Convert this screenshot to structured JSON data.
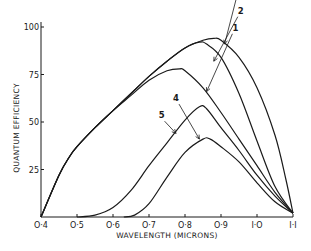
{
  "chart_data": {
    "type": "line",
    "title": "",
    "xlabel": "WAVELENGTH (MICRONS)",
    "ylabel": "QUANTUM EFFICIENCY",
    "xlim": [
      0.4,
      1.1
    ],
    "ylim": [
      0,
      100
    ],
    "grid": false,
    "x_ticks": [
      0.4,
      0.5,
      0.6,
      0.7,
      0.8,
      0.9,
      1.0,
      1.1
    ],
    "x_tick_labels": [
      "O·4",
      "O·5",
      "O·6",
      "O·7",
      "O·8",
      "O·9",
      "I·O",
      "I·I"
    ],
    "y_ticks": [
      25,
      50,
      75,
      100
    ],
    "y_tick_labels": [
      "25",
      "50",
      "75",
      "100"
    ],
    "series": [
      {
        "name": "1",
        "points": [
          [
            0.4,
            0
          ],
          [
            0.45,
            22
          ],
          [
            0.48,
            32
          ],
          [
            0.5,
            37
          ],
          [
            0.55,
            47
          ],
          [
            0.6,
            56
          ],
          [
            0.65,
            64
          ],
          [
            0.7,
            72
          ],
          [
            0.75,
            77
          ],
          [
            0.785,
            78
          ],
          [
            0.8,
            77
          ],
          [
            0.85,
            68
          ],
          [
            0.9,
            55
          ],
          [
            0.95,
            41
          ],
          [
            1.0,
            27
          ],
          [
            1.05,
            13
          ],
          [
            1.1,
            2
          ]
        ],
        "label_at": [
          0.94,
          98
        ],
        "arrow_to": [
          0.86,
          66
        ]
      },
      {
        "name": "2",
        "points": [
          [
            0.4,
            0
          ],
          [
            0.45,
            22
          ],
          [
            0.48,
            32
          ],
          [
            0.5,
            37
          ],
          [
            0.55,
            47
          ],
          [
            0.6,
            56
          ],
          [
            0.65,
            65
          ],
          [
            0.7,
            74
          ],
          [
            0.75,
            82
          ],
          [
            0.8,
            89
          ],
          [
            0.84,
            92
          ],
          [
            0.86,
            91
          ],
          [
            0.9,
            84
          ],
          [
            0.95,
            65
          ],
          [
            1.0,
            40
          ],
          [
            1.05,
            16
          ],
          [
            1.1,
            2
          ]
        ],
        "label_at": [
          0.955,
          107
        ],
        "arrow_to": [
          0.88,
          82
        ]
      },
      {
        "name": "3",
        "points": [
          [
            0.4,
            0
          ],
          [
            0.45,
            22
          ],
          [
            0.48,
            32
          ],
          [
            0.5,
            37
          ],
          [
            0.55,
            47
          ],
          [
            0.6,
            56
          ],
          [
            0.65,
            65
          ],
          [
            0.7,
            74
          ],
          [
            0.75,
            82
          ],
          [
            0.8,
            89
          ],
          [
            0.85,
            93
          ],
          [
            0.88,
            94
          ],
          [
            0.9,
            93
          ],
          [
            0.95,
            84
          ],
          [
            1.0,
            68
          ],
          [
            1.05,
            43
          ],
          [
            1.08,
            20
          ],
          [
            1.1,
            2
          ]
        ],
        "label_at": [
          0.95,
          116
        ],
        "arrow_to": [
          0.91,
          91
        ]
      },
      {
        "name": "4",
        "points": [
          [
            0.5,
            0
          ],
          [
            0.55,
            1
          ],
          [
            0.6,
            5
          ],
          [
            0.65,
            14
          ],
          [
            0.7,
            27
          ],
          [
            0.75,
            39
          ],
          [
            0.8,
            51
          ],
          [
            0.84,
            58
          ],
          [
            0.86,
            57
          ],
          [
            0.9,
            47
          ],
          [
            0.95,
            35
          ],
          [
            1.0,
            22
          ],
          [
            1.05,
            11
          ],
          [
            1.1,
            2
          ]
        ],
        "label_at": [
          0.775,
          61
        ],
        "arrow_to": [
          0.84,
          41
        ]
      },
      {
        "name": "5",
        "points": [
          [
            0.63,
            0
          ],
          [
            0.66,
            1
          ],
          [
            0.7,
            7
          ],
          [
            0.75,
            21
          ],
          [
            0.8,
            34
          ],
          [
            0.85,
            41
          ],
          [
            0.87,
            41
          ],
          [
            0.9,
            37
          ],
          [
            0.95,
            29
          ],
          [
            1.0,
            18
          ],
          [
            1.05,
            8
          ],
          [
            1.1,
            2
          ]
        ],
        "label_at": [
          0.735,
          52
        ],
        "arrow_to": [
          0.775,
          44
        ]
      }
    ]
  }
}
